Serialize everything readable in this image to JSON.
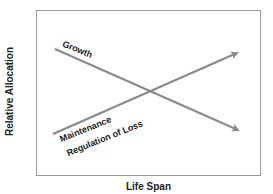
{
  "diagram": {
    "y_axis_label": "Relative Allocation",
    "x_axis_label": "Life Span",
    "curves": [
      {
        "name": "growth",
        "label": "Growth",
        "direction": "decreasing"
      },
      {
        "name": "maintenance",
        "label_line1": "Maintenance",
        "label_line2": "Regulation of Loss",
        "direction": "increasing"
      }
    ],
    "colors": {
      "arrow": "#8a8a8a",
      "frame": "#9a9a9a",
      "text": "#222222"
    }
  }
}
